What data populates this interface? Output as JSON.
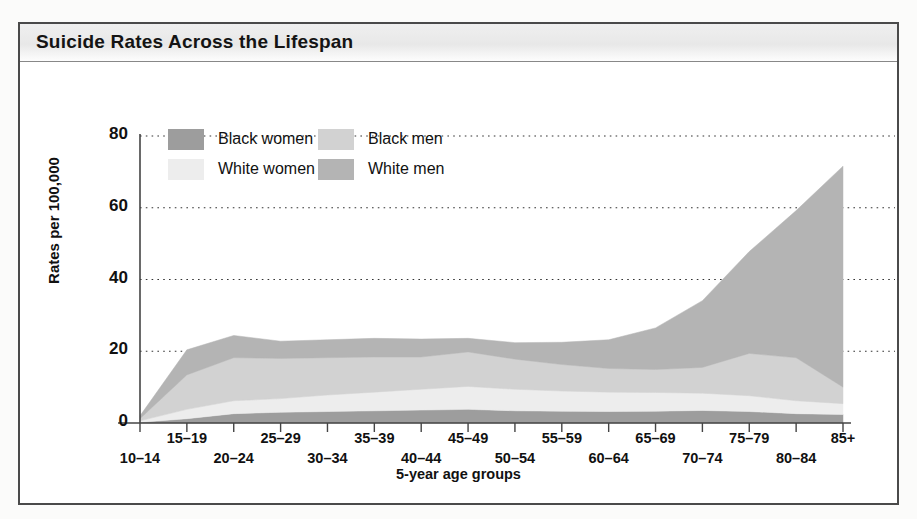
{
  "figure": {
    "title": "Suicide Rates Across the Lifespan"
  },
  "legend": {
    "position": "inside-top-left",
    "entries": [
      {
        "label": "Black women",
        "color": "#9d9d9d"
      },
      {
        "label": "Black men",
        "color": "#d2d2d2"
      },
      {
        "label": "White women",
        "color": "#ededed"
      },
      {
        "label": "White men",
        "color": "#b4b4b4"
      }
    ]
  },
  "chart_data": {
    "type": "area",
    "stacked": true,
    "title": "Suicide Rates Across the Lifespan",
    "xlabel": "5-year age groups",
    "ylabel": "Rates per 100,000",
    "ylim": [
      0,
      80
    ],
    "yticks": [
      0,
      20,
      40,
      60,
      80
    ],
    "grid": true,
    "grid_style": "dotted-horizontal",
    "categories": [
      "10–14",
      "15–19",
      "20–24",
      "25–29",
      "30–34",
      "35–39",
      "40–44",
      "45–49",
      "50–54",
      "55–59",
      "60–64",
      "65–69",
      "70–74",
      "75–79",
      "80–84",
      "85+"
    ],
    "stack_order_bottom_to_top": [
      "Black women",
      "White women",
      "Black men",
      "White men"
    ],
    "series": [
      {
        "name": "Black women",
        "color": "#9d9d9d",
        "values": [
          0.2,
          1.2,
          2.6,
          3.0,
          3.2,
          3.4,
          3.6,
          3.8,
          3.4,
          3.3,
          3.2,
          3.3,
          3.5,
          3.2,
          2.6,
          2.4
        ]
      },
      {
        "name": "White women",
        "color": "#ededed",
        "values": [
          0.4,
          2.6,
          3.6,
          3.8,
          4.6,
          5.2,
          5.8,
          6.4,
          6.0,
          5.6,
          5.4,
          5.2,
          4.8,
          4.4,
          3.6,
          3.0
        ]
      },
      {
        "name": "Black men",
        "color": "#d2d2d2",
        "values": [
          0.6,
          9.6,
          12.0,
          11.2,
          10.4,
          9.8,
          9.0,
          9.6,
          8.4,
          7.4,
          6.6,
          6.4,
          7.2,
          11.8,
          12.0,
          4.6
        ]
      },
      {
        "name": "White men",
        "color": "#b4b4b4",
        "values": [
          0.8,
          7.0,
          6.2,
          4.8,
          5.0,
          5.2,
          5.0,
          3.8,
          4.6,
          6.2,
          8.0,
          11.6,
          18.6,
          28.4,
          41.0,
          61.6
        ]
      }
    ],
    "totals": [
      2.0,
      20.4,
      24.4,
      22.8,
      23.2,
      23.6,
      23.4,
      23.6,
      22.4,
      22.5,
      23.2,
      26.5,
      34.1,
      47.8,
      59.2,
      71.6
    ],
    "peak": {
      "category": "85+",
      "total": 71.6
    }
  }
}
